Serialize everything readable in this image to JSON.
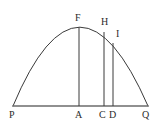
{
  "figure": {
    "kind": "geometry-diagram",
    "background_color": "#ffffff",
    "stroke_color": "#3a3a3a",
    "baseline_color": "#6b6b6b",
    "label_color": "#2b2b2b",
    "stroke_width": 1,
    "canvas": {
      "width": 157,
      "height": 133
    },
    "baseline": {
      "name": "PQ",
      "x1": 13,
      "y1": 106,
      "x2": 148,
      "y2": 106
    },
    "curve": {
      "name": "parabolic-arc",
      "start": {
        "x": 13,
        "y": 106
      },
      "apex": {
        "x": 79,
        "y": 27
      },
      "end": {
        "x": 148,
        "y": 106
      },
      "path": "M 13 106 Q 79 -52 148 106"
    },
    "verticals": [
      {
        "name": "FA",
        "top_label": "F",
        "bottom_label": "A",
        "x": 79,
        "y_top": 27,
        "y_bottom": 106
      },
      {
        "name": "HC",
        "top_label": "H",
        "bottom_label": "C",
        "x": 104,
        "y_top": 32,
        "y_bottom": 106
      },
      {
        "name": "ID",
        "top_label": "I",
        "bottom_label": "D",
        "x": 113,
        "y_top": 43,
        "y_bottom": 106
      }
    ],
    "labels": [
      {
        "id": "P",
        "text": "P",
        "x": 9,
        "y": 110,
        "role": "left-baseline-endpoint"
      },
      {
        "id": "A",
        "text": "A",
        "x": 75,
        "y": 110,
        "role": "foot-of-apex-vertical"
      },
      {
        "id": "C",
        "text": "C",
        "x": 99,
        "y": 110,
        "role": "foot-of-H-vertical"
      },
      {
        "id": "D",
        "text": "D",
        "x": 109,
        "y": 110,
        "role": "foot-of-I-vertical"
      },
      {
        "id": "Q",
        "text": "Q",
        "x": 142,
        "y": 110,
        "role": "right-baseline-endpoint"
      },
      {
        "id": "F",
        "text": "F",
        "x": 75,
        "y": 13,
        "role": "apex-of-curve"
      },
      {
        "id": "H",
        "text": "H",
        "x": 101,
        "y": 17,
        "role": "point-on-curve"
      },
      {
        "id": "I",
        "text": "I",
        "x": 116,
        "y": 29,
        "role": "point-on-curve"
      }
    ]
  }
}
